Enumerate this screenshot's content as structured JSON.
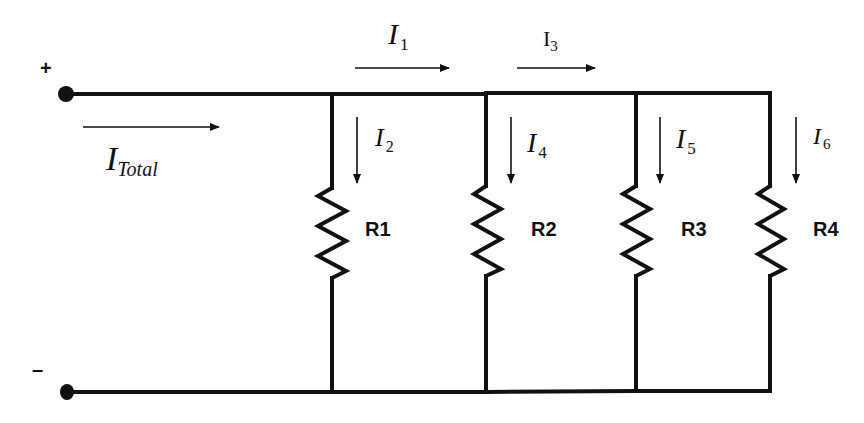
{
  "diagram": {
    "type": "parallel-resistor-circuit",
    "colors": {
      "line": "#111111",
      "background": "#ffffff"
    },
    "terminals": {
      "positive": {
        "label": "+"
      },
      "negative": {
        "label": "–"
      }
    },
    "currents": {
      "total": {
        "main": "I",
        "sub": "Total"
      },
      "i1": {
        "main": "I",
        "sub": "1"
      },
      "i2": {
        "main": "I",
        "sub": "2"
      },
      "i3": {
        "main": "I",
        "sub": "3"
      },
      "i4": {
        "main": "I",
        "sub": "4"
      },
      "i5": {
        "main": "I",
        "sub": "5"
      },
      "i6": {
        "main": "I",
        "sub": "6"
      }
    },
    "resistors": [
      {
        "label": "R1"
      },
      {
        "label": "R2"
      },
      {
        "label": "R3"
      },
      {
        "label": "R4"
      }
    ]
  }
}
